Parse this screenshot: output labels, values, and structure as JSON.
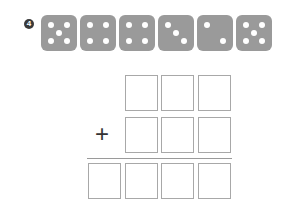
{
  "problem": {
    "number": "4"
  },
  "dice": [
    5,
    4,
    4,
    3,
    2,
    5
  ],
  "operator": "+",
  "grid": {
    "row1_boxes": 3,
    "row2_boxes": 3,
    "result_boxes": 4
  },
  "colors": {
    "die": "#9a9a9a",
    "pip": "#ffffff",
    "box_border": "#a8a8a8"
  }
}
